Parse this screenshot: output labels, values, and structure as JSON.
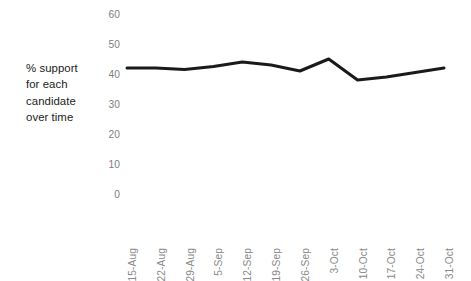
{
  "axis_title": {
    "lines": "% support\nfor each\ncandidate\nover time"
  },
  "chart_data": {
    "type": "line",
    "title": "",
    "subtitle": "",
    "xlabel": "",
    "ylabel": "% support for each candidate over time",
    "categories": [
      "15-Aug",
      "22-Aug",
      "29-Aug",
      "5-Sep",
      "12-Sep",
      "19-Sep",
      "26-Sep",
      "3-Oct",
      "10-Oct",
      "17-Oct",
      "24-Oct",
      "31-Oct"
    ],
    "series": [
      {
        "name": "% support",
        "color": "#1a1a1a",
        "values": [
          42,
          42,
          41.5,
          42.5,
          44,
          43,
          41,
          45,
          38,
          39,
          40.5,
          42
        ]
      }
    ],
    "ylim": [
      0,
      60
    ],
    "ytick_values": [
      60,
      50,
      40,
      30,
      20,
      10,
      0
    ],
    "ytick_labels": [
      "60",
      "50",
      "40",
      "30",
      "20",
      "10",
      "0"
    ],
    "grid": false,
    "legend": false,
    "legend_position": "none",
    "line_width": 3,
    "axis_label_color": "#7e7e7e",
    "xtick_rotation": -90
  }
}
